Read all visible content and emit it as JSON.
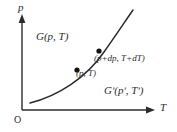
{
  "figure": {
    "background_color": "#ffffff",
    "line_color": "#2b2b2b",
    "axes": {
      "y_label": "p",
      "x_label": "T",
      "origin_label": "O"
    },
    "regions": [
      {
        "name": "phase-1",
        "label": "G(p, T)"
      },
      {
        "name": "phase-2",
        "label": "Gʹ(pʹ, Tʹ)"
      }
    ],
    "points": [
      {
        "name": "lower-point",
        "label": "(p, T)",
        "x": 77,
        "y": 70
      },
      {
        "name": "upper-point",
        "label": "(p+dp, T+dT)",
        "x": 99,
        "y": 51
      }
    ],
    "curve": {
      "name": "coexistence-curve",
      "description": "monotonically increasing convex curve",
      "path": "M 30 103 C 58 96, 86 78, 104 52 C 116 35, 126 20, 133 10"
    }
  }
}
